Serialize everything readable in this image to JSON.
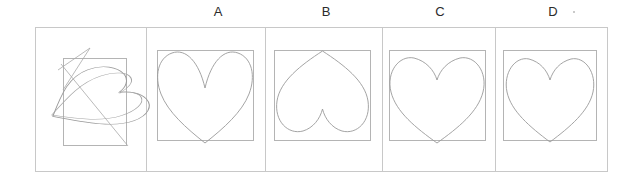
{
  "figure": {
    "type": "diagram",
    "background_color": "#ffffff",
    "line_color": "#9a9a9a",
    "frame_color": "#c8c8c8",
    "label_color": "#2b2b2b",
    "panel_count": 5,
    "labels": [
      {
        "id": "query",
        "text": "",
        "center_x": 90
      },
      {
        "id": "A",
        "text": "A",
        "center_x": 218
      },
      {
        "id": "B",
        "text": "B",
        "center_x": 326
      },
      {
        "id": "C",
        "text": "C",
        "center_x": 440
      },
      {
        "id": "D",
        "text": "D",
        "center_x": 553
      }
    ],
    "speck": {
      "x": 573,
      "y": 11
    },
    "frame": {
      "x": 35,
      "y": 27,
      "width": 573,
      "height": 145
    },
    "dividers": [
      146,
      265,
      382,
      495
    ],
    "panels": [
      {
        "id": "query",
        "label": "",
        "shape": "distorted-rotated-heart",
        "shape_note": "heart outline sheared and rotated about 45 degrees, overlapping a tall inner rectangle",
        "inner_rect": {
          "x": 63,
          "y": 58,
          "width": 63,
          "height": 87
        }
      },
      {
        "id": "A",
        "label": "A",
        "shape": "heart-upright-deep-cleft",
        "shape_note": "upright heart with a deep narrow V cleft at top",
        "inner_rect": {
          "x": 157,
          "y": 50,
          "width": 96,
          "height": 90
        }
      },
      {
        "id": "B",
        "label": "B",
        "shape": "heart-inverted",
        "shape_note": "heart rotated 180 degrees: point at top, two lobes at bottom",
        "inner_rect": {
          "x": 274,
          "y": 50,
          "width": 96,
          "height": 90
        }
      },
      {
        "id": "C",
        "label": "C",
        "shape": "heart-upright-shallow-cleft",
        "shape_note": "upright heart with a shallow rounded cleft at top",
        "inner_rect": {
          "x": 389,
          "y": 50,
          "width": 96,
          "height": 90
        }
      },
      {
        "id": "D",
        "label": "D",
        "shape": "heart-upright-shallow-cleft",
        "shape_note": "upright heart nearly identical to C, slightly narrower",
        "inner_rect": {
          "x": 503,
          "y": 50,
          "width": 93,
          "height": 90
        }
      }
    ]
  }
}
